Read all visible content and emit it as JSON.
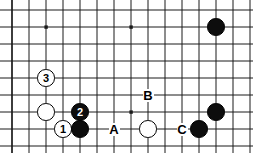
{
  "board": {
    "title": "Go board diagram",
    "width": 253,
    "height": 153,
    "grid": {
      "origin_x": 12,
      "origin_y": 10,
      "spacing": 17.0,
      "cols": 15,
      "rows": 9,
      "line_color": "#1a1a1a",
      "edge_color": "#1a1a1a",
      "background": "#ffffff"
    },
    "star_points": [
      {
        "col": 2,
        "row": 1
      },
      {
        "col": 7,
        "row": 1
      },
      {
        "col": 12,
        "row": 1
      },
      {
        "col": 7,
        "row": 6
      },
      {
        "col": 12,
        "row": 6
      }
    ],
    "stones": [
      {
        "id": "stone-black-top-right",
        "color": "black",
        "col": 12,
        "row": 1,
        "label": ""
      },
      {
        "id": "stone-white-move-3",
        "color": "white",
        "col": 2,
        "row": 4,
        "label": "3"
      },
      {
        "id": "stone-white-left",
        "color": "white",
        "col": 2,
        "row": 6,
        "label": ""
      },
      {
        "id": "stone-black-move-2",
        "color": "black",
        "col": 4,
        "row": 6,
        "label": "2"
      },
      {
        "id": "stone-white-move-1",
        "color": "white",
        "col": 3,
        "row": 7,
        "label": "1"
      },
      {
        "id": "stone-black-corner",
        "color": "black",
        "col": 4,
        "row": 7,
        "label": ""
      },
      {
        "id": "stone-white-center",
        "color": "white",
        "col": 8,
        "row": 7,
        "label": ""
      },
      {
        "id": "stone-black-right-low",
        "color": "black",
        "col": 11,
        "row": 7,
        "label": ""
      },
      {
        "id": "stone-black-right-high",
        "color": "black",
        "col": 12,
        "row": 6,
        "label": ""
      }
    ],
    "markers": [
      {
        "id": "marker-a",
        "label": "A",
        "col": 6,
        "row": 7
      },
      {
        "id": "marker-b",
        "label": "B",
        "col": 8,
        "row": 5
      },
      {
        "id": "marker-c",
        "label": "C",
        "col": 10,
        "row": 7
      }
    ],
    "colors": {
      "black_stone": "#0d0d0d",
      "white_stone": "#ffffff",
      "grid_line": "#1a1a1a",
      "marker_text": "#000000",
      "move_number_on_black": "#ffffff",
      "move_number_on_white": "#000000"
    },
    "move_numbers": [
      "1",
      "2",
      "3"
    ],
    "marker_letters": [
      "A",
      "B",
      "C"
    ]
  }
}
